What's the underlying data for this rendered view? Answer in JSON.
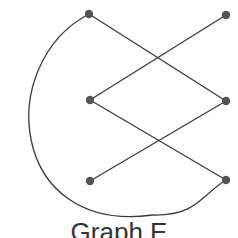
{
  "caption": "Graph E",
  "colors": {
    "edge": "#3a3a3a",
    "node": "#555555",
    "text": "#333333"
  },
  "nodes": [
    {
      "id": "top-left",
      "x": 89,
      "y": 14
    },
    {
      "id": "top-right",
      "x": 226,
      "y": 15
    },
    {
      "id": "middle-left",
      "x": 90,
      "y": 100
    },
    {
      "id": "middle-right",
      "x": 226,
      "y": 101
    },
    {
      "id": "bottom-left",
      "x": 90,
      "y": 181
    },
    {
      "id": "bottom-right",
      "x": 226,
      "y": 180
    }
  ],
  "edges": [
    {
      "from": "top-left",
      "to": "middle-right",
      "type": "straight"
    },
    {
      "from": "top-right",
      "to": "middle-left",
      "type": "straight"
    },
    {
      "from": "middle-left",
      "to": "bottom-right",
      "type": "straight"
    },
    {
      "from": "bottom-left",
      "to": "middle-right",
      "type": "straight"
    },
    {
      "from": "top-left",
      "to": "bottom-right",
      "type": "curved"
    }
  ]
}
